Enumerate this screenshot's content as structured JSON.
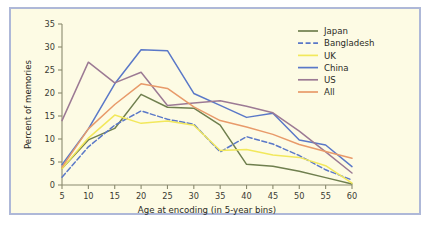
{
  "figure": {
    "background_color": "#fdfbe4",
    "border_color": "#aeb8d8"
  },
  "chart_data": {
    "type": "line",
    "title": "",
    "xlabel": "Age at encoding (in 5-year bins)",
    "ylabel": "Percent of memories",
    "categories": [
      5,
      10,
      15,
      20,
      25,
      30,
      35,
      40,
      45,
      50,
      55,
      60
    ],
    "xlim": [
      5,
      60
    ],
    "ylim": [
      0,
      35
    ],
    "xticks": [
      5,
      10,
      15,
      20,
      25,
      30,
      35,
      40,
      45,
      50,
      55,
      60
    ],
    "yticks": [
      0,
      5,
      10,
      15,
      20,
      25,
      30,
      35
    ],
    "grid": false,
    "legend_position": "top-right",
    "series": [
      {
        "name": "Japan",
        "color": "#6f7f4e",
        "style": "solid",
        "values": [
          3.6,
          9.8,
          12.3,
          19.7,
          16.9,
          16.7,
          13.0,
          4.5,
          4.1,
          3.0,
          1.6,
          0.2
        ]
      },
      {
        "name": "Bangladesh",
        "color": "#5a78c8",
        "style": "dashed",
        "values": [
          1.7,
          8.3,
          13.0,
          16.1,
          14.3,
          13.2,
          7.2,
          10.5,
          8.9,
          6.4,
          3.3,
          1.1
        ]
      },
      {
        "name": "UK",
        "color": "#f2e85c",
        "style": "solid",
        "values": [
          3.6,
          10.2,
          15.2,
          13.4,
          13.9,
          13.0,
          7.5,
          7.7,
          6.5,
          6.0,
          4.2,
          0.4
        ]
      },
      {
        "name": "China",
        "color": "#5a78c8",
        "style": "solid",
        "values": [
          4.4,
          12.2,
          22.0,
          29.4,
          29.2,
          19.9,
          17.3,
          14.7,
          15.6,
          9.8,
          8.7,
          4.0
        ]
      },
      {
        "name": "US",
        "color": "#9c7a94",
        "style": "solid",
        "values": [
          14.0,
          26.7,
          22.2,
          24.5,
          17.3,
          17.8,
          18.3,
          17.1,
          15.7,
          11.7,
          7.2,
          2.6
        ]
      },
      {
        "name": "All",
        "color": "#e89a6a",
        "style": "solid",
        "values": [
          3.9,
          12.2,
          17.5,
          22.0,
          21.0,
          17.0,
          14.0,
          12.6,
          11.0,
          8.8,
          7.3,
          5.8
        ]
      }
    ]
  },
  "legend": {
    "entries": [
      {
        "label": "Japan"
      },
      {
        "label": "Bangladesh"
      },
      {
        "label": "UK"
      },
      {
        "label": "China"
      },
      {
        "label": "US"
      },
      {
        "label": "All"
      }
    ]
  }
}
